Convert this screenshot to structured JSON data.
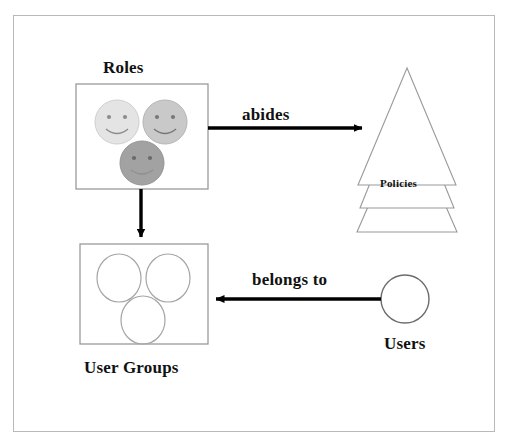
{
  "diagram": {
    "frame": {
      "border_color": "#b9b9b9",
      "background": "#ffffff"
    },
    "nodes": [
      {
        "id": "roles",
        "label": "Roles",
        "shape": "square-box",
        "border_color": "#9a9a9a",
        "contents": "three smiley-face circles",
        "items": [
          {
            "name": "smiley-face-light",
            "fill": "#e2e2e2"
          },
          {
            "name": "smiley-face-medium",
            "fill": "#c8c8c8"
          },
          {
            "name": "smiley-face-dark",
            "fill": "#a0a0a0"
          }
        ]
      },
      {
        "id": "policies",
        "label": "Policies",
        "shape": "stacked-triangles",
        "border_color": "#9a9a9a",
        "count": 3
      },
      {
        "id": "user-groups",
        "label": "User Groups",
        "shape": "square-box",
        "border_color": "#9a9a9a",
        "contents": "three empty circles",
        "items": [
          {
            "name": "group-circle-1",
            "fill": "none"
          },
          {
            "name": "group-circle-2",
            "fill": "none"
          },
          {
            "name": "group-circle-3",
            "fill": "none"
          }
        ]
      },
      {
        "id": "users",
        "label": "Users",
        "shape": "circle",
        "border_color": "#6b6b6b",
        "fill": "none"
      }
    ],
    "edges": [
      {
        "id": "roles-abides-policies",
        "label": "abides",
        "from": "roles",
        "to": "policies",
        "direction": "right",
        "color": "#000000"
      },
      {
        "id": "roles-to-user-groups",
        "label": "",
        "from": "roles",
        "to": "user-groups",
        "direction": "down",
        "color": "#000000"
      },
      {
        "id": "users-belongs-to-user-groups",
        "label": "belongs to",
        "from": "users",
        "to": "user-groups",
        "direction": "left",
        "color": "#000000"
      }
    ],
    "colors": {
      "line": "#000000",
      "shape_stroke": "#9a9a9a",
      "frame_stroke": "#b9b9b9",
      "text": "#111111"
    }
  }
}
